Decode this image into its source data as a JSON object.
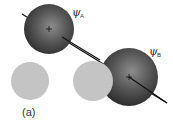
{
  "figure": {
    "panel_label": "(a)",
    "orbital_a": {
      "symbol": "ψ",
      "subscript": "A"
    },
    "orbital_b": {
      "symbol": "ψ",
      "subscript": "B"
    }
  },
  "colors": {
    "sphere_dark": "#3a3a3a",
    "sphere_light": "#8a8a8a",
    "disc_gray": "#c4c4c4",
    "line": "#111111"
  }
}
